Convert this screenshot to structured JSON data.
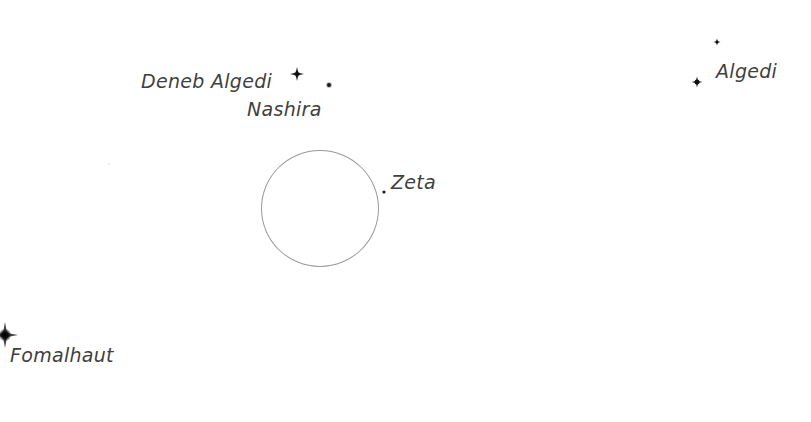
{
  "map": {
    "type": "star-chart",
    "background_color": "#ffffff",
    "label_color": "#3f3f3f",
    "star_color": "#111111",
    "circle_color": "#9a9a9a"
  },
  "circle": {
    "name": "target-marker",
    "center": [
      320,
      208
    ],
    "radius": 59
  },
  "stars": [
    {
      "id": "deneb-algedi",
      "x": 297,
      "y": 74,
      "size": 14
    },
    {
      "id": "nashira",
      "x": 329,
      "y": 85,
      "size": 7
    },
    {
      "id": "algedi-a",
      "x": 717,
      "y": 42,
      "size": 7
    },
    {
      "id": "algedi-b",
      "x": 697,
      "y": 82,
      "size": 11
    },
    {
      "id": "zeta",
      "x": 384,
      "y": 192,
      "size": 5
    },
    {
      "id": "fomalhaut",
      "x": 5,
      "y": 335,
      "size": 26
    }
  ],
  "labels": {
    "deneb_algedi": "Deneb Algedi",
    "nashira": "Nashira",
    "algedi": "Algedi",
    "zeta": "Zeta",
    "fomalhaut": "Fomalhaut"
  }
}
